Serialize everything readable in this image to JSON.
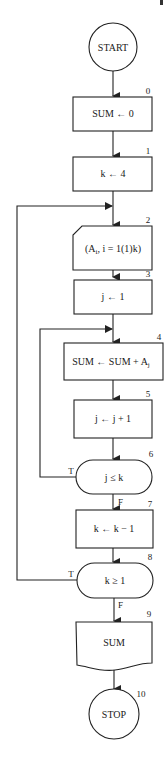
{
  "flowchart": {
    "nodes": [
      {
        "id": "start",
        "number": "",
        "type": "terminal-circle",
        "label": "START"
      },
      {
        "id": "n0",
        "number": "0",
        "type": "process",
        "label": "SUM ← 0"
      },
      {
        "id": "n1",
        "number": "1",
        "type": "process",
        "label": "k ← 4"
      },
      {
        "id": "n2",
        "number": "2",
        "type": "input",
        "label_main": "(A",
        "label_sub": "i",
        "label_rest": ", i = 1(1)k)"
      },
      {
        "id": "n3",
        "number": "3",
        "type": "process",
        "label": "j ← 1"
      },
      {
        "id": "n4",
        "number": "4",
        "type": "process",
        "label_main": "SUM ← SUM + A",
        "label_sub": "j"
      },
      {
        "id": "n5",
        "number": "5",
        "type": "process",
        "label": "j ← j + 1"
      },
      {
        "id": "n6",
        "number": "6",
        "type": "decision",
        "label": "j ≤ k",
        "true_label": "T",
        "false_label": "F"
      },
      {
        "id": "n7",
        "number": "7",
        "type": "process",
        "label": "k ← k − 1"
      },
      {
        "id": "n8",
        "number": "8",
        "type": "decision",
        "label": "k ≥ 1",
        "true_label": "T",
        "false_label": "F"
      },
      {
        "id": "n9",
        "number": "9",
        "type": "output",
        "label": "SUM"
      },
      {
        "id": "stop",
        "number": "10",
        "type": "terminal-circle",
        "label": "STOP"
      }
    ],
    "edges": [
      {
        "from": "start",
        "to": "n0"
      },
      {
        "from": "n0",
        "to": "n1"
      },
      {
        "from": "n1",
        "to": "n2"
      },
      {
        "from": "n2",
        "to": "n3"
      },
      {
        "from": "n3",
        "to": "n4"
      },
      {
        "from": "n4",
        "to": "n5"
      },
      {
        "from": "n5",
        "to": "n6"
      },
      {
        "from": "n6",
        "to": "n4",
        "label": "T"
      },
      {
        "from": "n6",
        "to": "n7",
        "label": "F"
      },
      {
        "from": "n7",
        "to": "n8"
      },
      {
        "from": "n8",
        "to": "n2",
        "label": "T"
      },
      {
        "from": "n8",
        "to": "n9",
        "label": "F"
      },
      {
        "from": "n9",
        "to": "stop"
      }
    ]
  }
}
